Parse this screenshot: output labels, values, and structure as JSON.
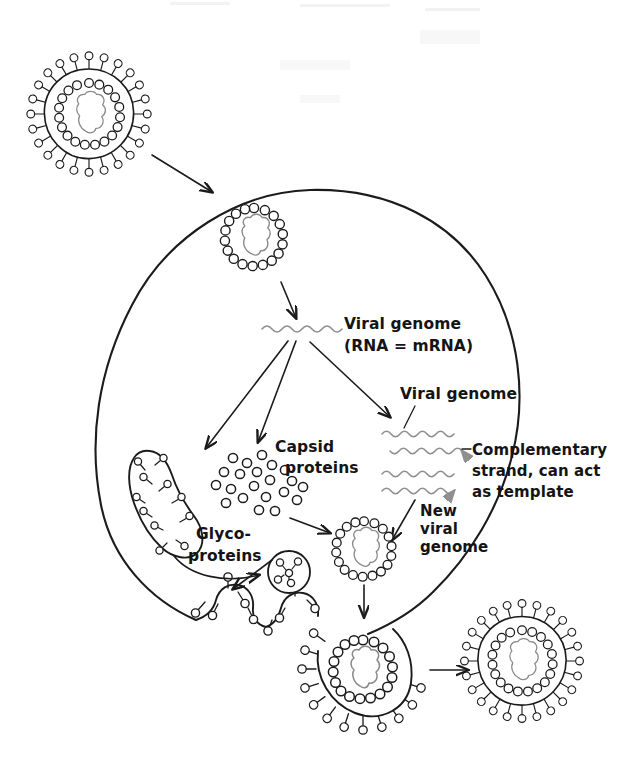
{
  "diagram": {
    "background_color": "#ffffff",
    "ink_color": "#1b1b1b",
    "rna_color": "#8a8a8a",
    "strand_color": "#8f8f8f"
  },
  "labels": {
    "viral_genome_main_line1": "Viral genome",
    "viral_genome_main_line2": "(RNA = mRNA)",
    "viral_genome_right": "Viral genome",
    "complementary_line1": "Complementary",
    "complementary_line2": "strand, can act",
    "complementary_line3": "as template",
    "capsid_line1": "Capsid",
    "capsid_line2": "proteins",
    "glyco_line1": "Glyco-",
    "glyco_line2": "proteins",
    "new_viral_line1": "New",
    "new_viral_line2": "viral",
    "new_viral_line3": "genome"
  },
  "structures": {
    "entering_virion": "enveloped-virion-with-spikes",
    "internalized_nucleocapsid": "nucleocapsid-in-vesicle",
    "er_organelle": "rough-er-with-glycoproteins",
    "capsid_protein_pool": "free-capsid-protein-dots",
    "transport_vesicle": "vesicle-with-glycoproteins",
    "assembled_nucleocapsid": "new-nucleocapsid",
    "budding_virion": "budding-virion-at-membrane",
    "released_virion": "released-enveloped-virion",
    "cell_membrane": "host-cell-plasma-membrane"
  },
  "counts": {
    "capsid_protein_dots": 21,
    "entering_virion_spikes": 24,
    "released_virion_spikes": 24
  }
}
